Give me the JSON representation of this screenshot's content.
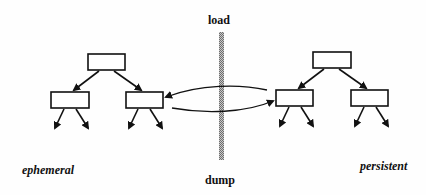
{
  "diagram": {
    "labels": {
      "top": "load",
      "bottom": "dump",
      "left": "ephemeral",
      "right": "persistent"
    },
    "colors": {
      "stroke": "#111111",
      "barrier": "#9a9a9a",
      "background": "#fefefe"
    },
    "trees": [
      {
        "name": "ephemeral-tree",
        "nodes": 3,
        "leaf_arrows": 4
      },
      {
        "name": "persistent-tree",
        "nodes": 3,
        "leaf_arrows": 4
      }
    ],
    "connection": "bidirectional loop between left tree right child and right tree left child across barrier"
  }
}
